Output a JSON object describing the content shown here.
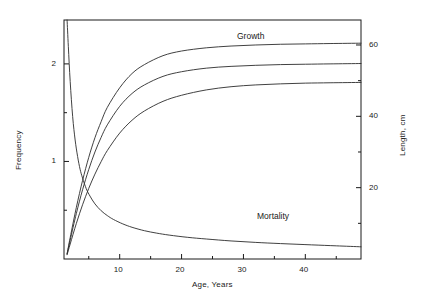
{
  "chart_data": {
    "type": "line",
    "title": "",
    "xlabel": "Age, Years",
    "ylabel_left": "Frequency",
    "ylabel_right": "Length, cm",
    "xlim": [
      1,
      49
    ],
    "ylim_left": [
      0,
      2.45
    ],
    "ylim_right": [
      0,
      67
    ],
    "grid": false,
    "legend": "inline-annotations",
    "xticks_major": [
      10,
      20,
      30,
      40
    ],
    "xticks_minor": [
      5,
      15,
      25,
      35,
      45
    ],
    "yticks_left_major": [
      1,
      2
    ],
    "yticks_left_minor": [
      0.5,
      1.5
    ],
    "yticks_right_major": [
      20,
      40,
      60
    ],
    "yticks_right_minor": [
      10,
      30,
      50
    ],
    "annotations": [
      {
        "text": "Growth",
        "x": 31,
        "y_right": 64
      },
      {
        "text": "Mortality",
        "x": 35,
        "y_right": 9
      }
    ],
    "series": [
      {
        "name": "Frequency",
        "axis": "left",
        "label": "Mortality",
        "x": [
          1.5,
          1.7,
          2.0,
          2.4,
          2.8,
          3.2,
          3.6,
          4.0,
          4.6,
          5.2,
          6.0,
          7.0,
          8.0,
          9.0,
          10.5,
          12.0,
          14.0,
          16.0,
          18.0,
          21.0,
          24.0,
          28.0,
          32.0,
          36.0,
          41.0,
          45.0,
          49.0
        ],
        "y": [
          2.45,
          2.18,
          1.82,
          1.46,
          1.22,
          1.05,
          0.92,
          0.83,
          0.72,
          0.645,
          0.565,
          0.495,
          0.445,
          0.405,
          0.36,
          0.325,
          0.29,
          0.265,
          0.245,
          0.222,
          0.205,
          0.185,
          0.17,
          0.158,
          0.145,
          0.135,
          0.125
        ]
      },
      {
        "name": "Growth upper",
        "axis": "right",
        "label": "Growth",
        "x": [
          1.5,
          2,
          3,
          4,
          5,
          6,
          7,
          8,
          10,
          12,
          14,
          17,
          20,
          24,
          28,
          32,
          36,
          40,
          44,
          49
        ],
        "y": [
          1.5,
          6.0,
          14.5,
          22.0,
          28.5,
          34.0,
          38.5,
          42.5,
          48.0,
          52.0,
          54.5,
          57.0,
          58.3,
          59.2,
          59.7,
          60.0,
          60.2,
          60.3,
          60.4,
          60.5
        ]
      },
      {
        "name": "Growth middle",
        "axis": "right",
        "label": "Growth",
        "x": [
          1.5,
          2,
          3,
          4,
          5,
          6,
          7,
          8,
          10,
          12,
          14,
          17,
          20,
          24,
          28,
          32,
          36,
          40,
          44,
          49
        ],
        "y": [
          1.4,
          5.3,
          12.8,
          19.4,
          25.1,
          30.0,
          34.1,
          37.6,
          42.8,
          46.4,
          48.8,
          51.2,
          52.5,
          53.5,
          54.0,
          54.3,
          54.5,
          54.6,
          54.7,
          54.8
        ]
      },
      {
        "name": "Growth lower",
        "axis": "right",
        "label": "Growth",
        "x": [
          1.5,
          2,
          3,
          4,
          5,
          6,
          7,
          8,
          10,
          12,
          14,
          17,
          20,
          24,
          28,
          32,
          36,
          40,
          44,
          49
        ],
        "y": [
          1.2,
          4.2,
          10.0,
          15.2,
          19.8,
          23.8,
          27.3,
          30.4,
          35.3,
          38.9,
          41.5,
          44.2,
          45.9,
          47.4,
          48.3,
          48.8,
          49.1,
          49.3,
          49.4,
          49.5
        ]
      }
    ]
  },
  "labels": {
    "xlabel": "Age, Years",
    "ylabel_left": "Frequency",
    "ylabel_right": "Length, cm",
    "growth": "Growth",
    "mortality": "Mortality",
    "xtick_10": "10",
    "xtick_20": "20",
    "xtick_30": "30",
    "xtick_40": "40",
    "ytick_left_1": "1",
    "ytick_left_2": "2",
    "ytick_right_20": "20",
    "ytick_right_40": "40",
    "ytick_right_60": "60"
  },
  "colors": {
    "background": "#ffffff",
    "ink": "#1a1a1a",
    "curve": "#2b2b2b"
  }
}
